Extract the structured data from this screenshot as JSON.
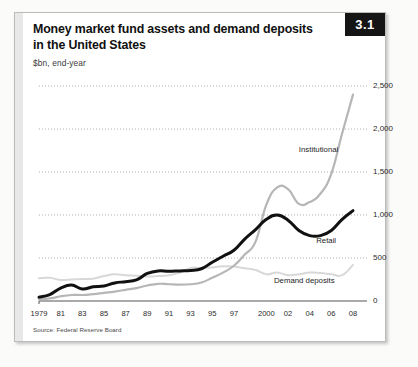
{
  "figure": {
    "number": "3.1",
    "title_line1": "Money market fund assets and demand deposits",
    "title_line2": "in the United States",
    "subtitle": "$bn, end-year",
    "source": "Source: Federal Reserve Board"
  },
  "colors": {
    "retail_line": "#111111",
    "institutional_line": "#b6b6b6",
    "demand_deposits_line": "#d8d8d8",
    "gridline": "#9a9a9a",
    "axis": "#555555",
    "figure_badge_bg": "#151515",
    "frame_border": "#bcbcbc"
  },
  "chart_data": {
    "type": "line",
    "title": "Money market fund assets and demand deposits in the United States",
    "subtitle": "$bn, end-year",
    "xlabel": "",
    "ylabel": "$bn",
    "ylim": [
      0,
      2500
    ],
    "xlim": [
      1979,
      2008
    ],
    "grid": true,
    "legend": "inline-annotations",
    "ytick_labels": [
      "0",
      "500",
      "1,000",
      "1,500",
      "2,000",
      "2,500"
    ],
    "ytick_values": [
      0,
      500,
      1000,
      1500,
      2000,
      2500
    ],
    "xtick_labels": [
      "1979",
      "81",
      "83",
      "85",
      "87",
      "89",
      "91",
      "93",
      "95",
      "97",
      "2000",
      "02",
      "04",
      "06",
      "08"
    ],
    "xtick_values": [
      1979,
      1981,
      1983,
      1985,
      1987,
      1989,
      1991,
      1993,
      1995,
      1997,
      2000,
      2002,
      2004,
      2006,
      2008
    ],
    "x": [
      1979,
      1980,
      1981,
      1982,
      1983,
      1984,
      1985,
      1986,
      1987,
      1988,
      1989,
      1990,
      1991,
      1992,
      1993,
      1994,
      1995,
      1996,
      1997,
      1998,
      1999,
      2000,
      2001,
      2002,
      2003,
      2004,
      2005,
      2006,
      2007,
      2008
    ],
    "series": [
      {
        "name": "Retail",
        "color": "#111111",
        "label_text": "Retail",
        "values": [
          45,
          75,
          150,
          185,
          140,
          165,
          175,
          210,
          225,
          245,
          320,
          350,
          345,
          350,
          355,
          375,
          450,
          520,
          590,
          720,
          830,
          950,
          1000,
          940,
          820,
          760,
          760,
          820,
          950,
          1050
        ]
      },
      {
        "name": "Institutional",
        "color": "#b6b6b6",
        "label_text": "Institutional",
        "values": [
          20,
          30,
          55,
          70,
          70,
          80,
          95,
          110,
          130,
          150,
          180,
          200,
          195,
          190,
          195,
          215,
          270,
          330,
          410,
          540,
          690,
          1120,
          1320,
          1300,
          1130,
          1150,
          1250,
          1480,
          1950,
          2400
        ]
      },
      {
        "name": "Demand deposits",
        "color": "#d8d8d8",
        "label_text": "Demand deposits",
        "values": [
          265,
          270,
          245,
          250,
          255,
          260,
          290,
          310,
          300,
          295,
          285,
          290,
          300,
          330,
          385,
          385,
          390,
          405,
          400,
          380,
          360,
          310,
          330,
          300,
          310,
          330,
          325,
          310,
          300,
          420
        ]
      }
    ],
    "annotations": [
      {
        "text": "Institutional",
        "x": 2003.0,
        "y": 1760
      },
      {
        "text": "Retail",
        "x": 2004.6,
        "y": 700
      },
      {
        "text": "Demand deposits",
        "x": 2000.7,
        "y": 230
      }
    ]
  }
}
